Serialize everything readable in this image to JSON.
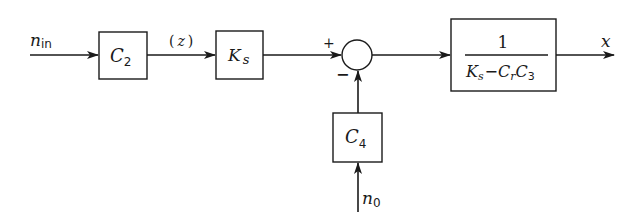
{
  "diagram": {
    "type": "block-diagram",
    "colors": {
      "stroke": "#1a1a1a",
      "background": "#ffffff"
    },
    "signals": {
      "input": {
        "symbol": "n",
        "subscript": "in"
      },
      "intermediate": {
        "text": "(z)",
        "var": "z",
        "open": "(",
        "close": ")"
      },
      "disturbance": {
        "symbol": "n",
        "subscript": "0"
      },
      "output": {
        "symbol": "x"
      }
    },
    "blocks": [
      {
        "id": "C2",
        "symbol": "C",
        "subscript": "2"
      },
      {
        "id": "Ks",
        "symbol": "K",
        "subscript": "s"
      },
      {
        "id": "C4",
        "symbol": "C",
        "subscript": "4"
      },
      {
        "id": "plant",
        "numerator": "1",
        "denominator": {
          "t1": "K",
          "t1_sub": "s",
          "op": "−",
          "t2": "C",
          "t2_sub": "r",
          "t3": "C",
          "t3_sub": "3"
        }
      }
    ],
    "summing_junction": {
      "plus_sign": "+",
      "minus_sign": "−"
    },
    "connections": [
      "n_in -> C2",
      "C2 -> Ks (z)",
      "Ks -> sum (+)",
      "C4 -> sum (-)",
      "n0 -> C4",
      "sum -> 1/(Ks - Cr C3)",
      "1/(Ks - Cr C3) -> x"
    ]
  }
}
